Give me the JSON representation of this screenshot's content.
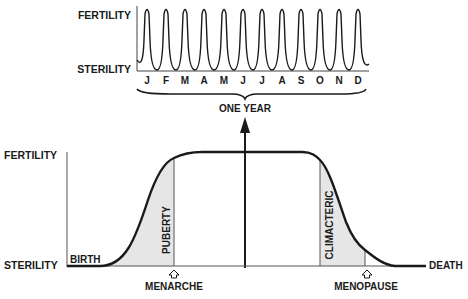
{
  "top_chart": {
    "y_labels": {
      "top": "FERTILITY",
      "bottom": "STERILITY"
    },
    "months": [
      "J",
      "F",
      "M",
      "A",
      "M",
      "J",
      "J",
      "A",
      "S",
      "O",
      "N",
      "D"
    ],
    "brace_label": "ONE YEAR"
  },
  "bottom_chart": {
    "y_labels": {
      "top": "FERTILITY",
      "bottom": "STERILITY"
    },
    "start_label": "BIRTH",
    "end_label": "DEATH",
    "phase_labels": {
      "rise": "PUBERTY",
      "fall": "CLIMACTERIC"
    },
    "markers": {
      "rise": "MENARCHE",
      "fall": "MENOPAUSE"
    }
  },
  "colors": {
    "line": "#1a1a1a",
    "shade": "#e4e4e4",
    "axis": "#555555"
  }
}
